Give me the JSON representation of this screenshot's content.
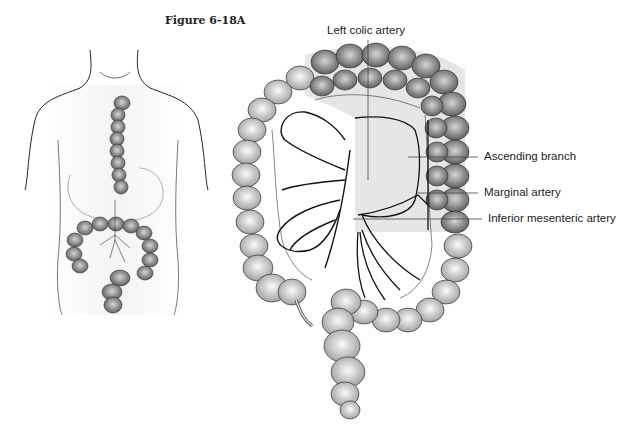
{
  "figure": {
    "title": "Figure 6-18A"
  },
  "labels": [
    {
      "id": "left-colic-artery",
      "text": "Left colic artery"
    },
    {
      "id": "ascending-branch",
      "text": "Ascending branch"
    },
    {
      "id": "marginal-artery",
      "text": "Marginal artery"
    },
    {
      "id": "inferior-mesenteric-artery",
      "text": "Inferior mesenteric artery"
    }
  ],
  "colors": {
    "outline": "#222222",
    "colon_light": "#d9d9d9",
    "colon_dark": "#8a8a8a",
    "shade": "#e8e8e8",
    "leader": "#444444"
  }
}
